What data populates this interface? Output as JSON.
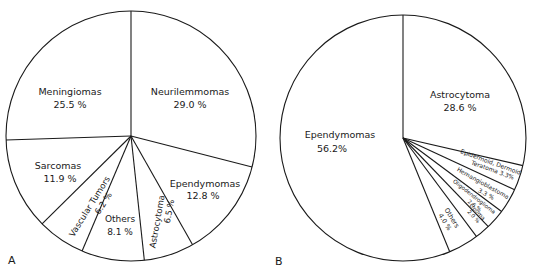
{
  "chart_data": [
    {
      "type": "pie",
      "panel_label": "A",
      "title": "",
      "start_angle_deg": 0,
      "direction": "clockwise",
      "center": [
        131,
        136
      ],
      "radius": 125,
      "slices": [
        {
          "label": "Neurilemmomas",
          "value": 29.0,
          "value_text": "29.0 %"
        },
        {
          "label": "Ependymomas",
          "value": 12.8,
          "value_text": "12.8 %"
        },
        {
          "label": "Astrocytoma",
          "value": 6.5,
          "value_text": "6.5 %"
        },
        {
          "label": "Others",
          "value": 8.1,
          "value_text": "8.1 %"
        },
        {
          "label": "Vascular Tumors",
          "value": 6.2,
          "value_text": "6.2 %"
        },
        {
          "label": "Sarcomas",
          "value": 11.9,
          "value_text": "11.9 %"
        },
        {
          "label": "Meningiomas",
          "value": 25.5,
          "value_text": "25.5 %"
        }
      ]
    },
    {
      "type": "pie",
      "panel_label": "B",
      "title": "",
      "start_angle_deg": 0,
      "direction": "clockwise",
      "center": [
        403,
        138
      ],
      "radius": 123,
      "slices": [
        {
          "label": "Astrocytoma",
          "value": 28.6,
          "value_text": "28.6 %"
        },
        {
          "label": "Epidermoid, Dermoid Teratoma",
          "value": 3.3,
          "value_text": "3.3%"
        },
        {
          "label": "Hemangioblastoma",
          "value": 3.3,
          "value_text": "3.3 %"
        },
        {
          "label": "Oligodendroglioma",
          "value": 2.6,
          "value_text": "2.6 %"
        },
        {
          "label": "Lipoma",
          "value": 2.0,
          "value_text": "2.0 %"
        },
        {
          "label": "Others",
          "value": 4.0,
          "value_text": "4.0 %"
        },
        {
          "label": "Ependymomas",
          "value": 56.2,
          "value_text": "56.2%"
        }
      ]
    }
  ]
}
